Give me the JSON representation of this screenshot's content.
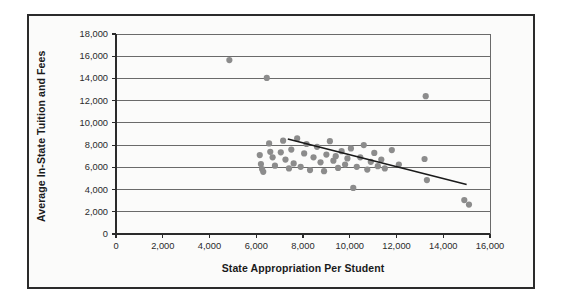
{
  "chart_data": {
    "type": "scatter",
    "title": "",
    "xlabel": "State Appropriation Per Student",
    "ylabel": "Average In-State Tuition and Fees",
    "xlim": [
      0,
      16000
    ],
    "ylim": [
      0,
      18000
    ],
    "xticks": [
      "0",
      "2,000",
      "4,000",
      "6,000",
      "8,000",
      "10,000",
      "12,000",
      "14,000",
      "16,000"
    ],
    "xtick_values": [
      0,
      2000,
      4000,
      6000,
      8000,
      10000,
      12000,
      14000,
      16000
    ],
    "yticks": [
      "0",
      "2,000",
      "4,000",
      "6,000",
      "8,000",
      "10,000",
      "12,000",
      "14,000",
      "16,000",
      "18,000"
    ],
    "ytick_values": [
      0,
      2000,
      4000,
      6000,
      8000,
      10000,
      12000,
      14000,
      16000,
      18000
    ],
    "grid": "horizontal",
    "legend": "none",
    "point_color": "#8c8c8c",
    "trendline_color": "#1a1a1a",
    "gridline_color": "#5a5a5a",
    "points": [
      [
        4850,
        15650
      ],
      [
        6450,
        14050
      ],
      [
        13250,
        12400
      ],
      [
        6150,
        7100
      ],
      [
        6200,
        6300
      ],
      [
        6250,
        5850
      ],
      [
        6300,
        5600
      ],
      [
        6550,
        8150
      ],
      [
        6600,
        7400
      ],
      [
        6700,
        6900
      ],
      [
        6800,
        6150
      ],
      [
        7050,
        7350
      ],
      [
        7150,
        8400
      ],
      [
        7250,
        6700
      ],
      [
        7400,
        5900
      ],
      [
        7500,
        7600
      ],
      [
        7600,
        6350
      ],
      [
        7750,
        8600
      ],
      [
        7900,
        6050
      ],
      [
        8050,
        7250
      ],
      [
        8150,
        8100
      ],
      [
        8300,
        5750
      ],
      [
        8450,
        6900
      ],
      [
        8600,
        7850
      ],
      [
        8750,
        6450
      ],
      [
        8900,
        5650
      ],
      [
        9000,
        7150
      ],
      [
        9150,
        8350
      ],
      [
        9300,
        6600
      ],
      [
        9400,
        7000
      ],
      [
        9500,
        5950
      ],
      [
        9650,
        7450
      ],
      [
        9800,
        6250
      ],
      [
        9900,
        6800
      ],
      [
        10050,
        7700
      ],
      [
        10150,
        4150
      ],
      [
        10300,
        6050
      ],
      [
        10450,
        6900
      ],
      [
        10600,
        8000
      ],
      [
        10750,
        5800
      ],
      [
        10900,
        6500
      ],
      [
        11050,
        7300
      ],
      [
        11200,
        6100
      ],
      [
        11350,
        6700
      ],
      [
        11500,
        5900
      ],
      [
        11800,
        7550
      ],
      [
        12100,
        6250
      ],
      [
        13200,
        6750
      ],
      [
        13300,
        4850
      ],
      [
        14900,
        3050
      ],
      [
        15100,
        2650
      ]
    ],
    "trendline": {
      "x_start": 7350,
      "y_start": 8550,
      "x_end": 15000,
      "y_end": 4450
    }
  }
}
